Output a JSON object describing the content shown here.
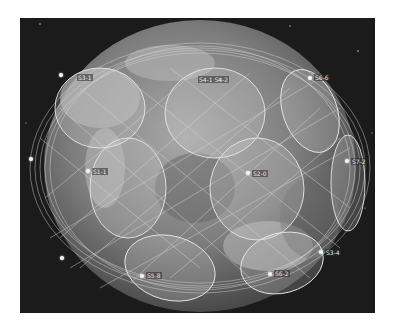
{
  "scene": {
    "description": "Satellite constellation coverage over Earth globe (grayscale)",
    "colors": {
      "space": "#1b1b1b",
      "globe_light": "#9a9a9a",
      "globe_dark": "#5c5c5c",
      "coverage_fill": "rgba(220,220,220,0.25)",
      "coverage_stroke": "#e6e6e6",
      "orbit_lines": "#d8d8d8"
    }
  },
  "satellites": [
    {
      "id": "sat-1",
      "label": "S3-1",
      "x": 41,
      "y": 57
    },
    {
      "id": "sat-2",
      "label": "S4-1 S4-2",
      "x": 200,
      "y": 62
    },
    {
      "id": "sat-3",
      "label": "S6-6",
      "x": 290,
      "y": 60
    },
    {
      "id": "sat-4",
      "label": "S1-1",
      "x": 68,
      "y": 153
    },
    {
      "id": "sat-5",
      "label": "S2-0",
      "x": 228,
      "y": 155
    },
    {
      "id": "sat-6",
      "label": "S7-2",
      "x": 327,
      "y": 143
    },
    {
      "id": "sat-7",
      "label": "S3-4",
      "x": 301,
      "y": 234
    },
    {
      "id": "sat-8",
      "label": "S5-8",
      "x": 122,
      "y": 258
    },
    {
      "id": "sat-9",
      "label": "S6-2",
      "x": 250,
      "y": 256
    },
    {
      "id": "sat-10",
      "label": "",
      "x": 42,
      "y": 240
    },
    {
      "id": "sat-11",
      "label": "",
      "x": 11,
      "y": 141
    }
  ]
}
